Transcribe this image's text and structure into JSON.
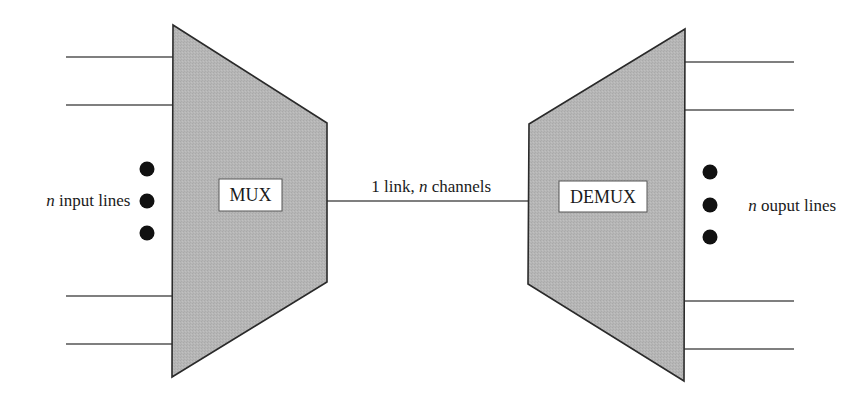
{
  "diagram": {
    "type": "multiplexing",
    "colors": {
      "block_fill": "#b4b4b4",
      "block_stroke": "#2a2a2a",
      "line": "#555555",
      "dot": "#111111",
      "label_box_fill": "#ffffff",
      "text": "#1a1a1a"
    },
    "mux": {
      "label": "MUX",
      "inputs_label_var": "n",
      "inputs_label_text": " input lines"
    },
    "link": {
      "count": "1",
      "text_prefix": "1 link, ",
      "var": "n",
      "text_suffix": " channels"
    },
    "demux": {
      "label": "DEMUX",
      "outputs_label_var": "n",
      "outputs_label_text": " ouput lines"
    },
    "input_lines_shown": 4,
    "output_lines_shown": 4,
    "ellipsis_dots": 3
  }
}
